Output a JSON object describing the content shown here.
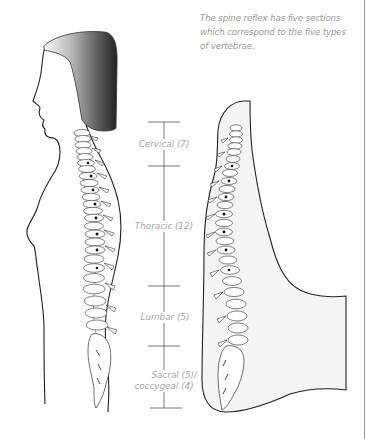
{
  "caption": {
    "line1": "The spine reflex has five sections",
    "line2": "which correspond to the five types",
    "line3": "of vertebrae."
  },
  "scale": {
    "segments": [
      {
        "label": "Cervical (7)",
        "top": 122,
        "bottom": 166
      },
      {
        "label": "Thoracic (12)",
        "top": 166,
        "bottom": 286
      },
      {
        "label": "Lumbar (5)",
        "top": 286,
        "bottom": 346
      },
      {
        "label": "Sacral (5)/",
        "label2": "coccygeal (4)",
        "top": 346,
        "bottom": 408
      }
    ]
  },
  "figures": {
    "left": "side-profile-woman-with-spine",
    "right": "foot-sole-with-spine-reflex-zone"
  },
  "colors": {
    "line": "#222222",
    "label": "#a5a5a5",
    "hair_light": "#f2f2f2",
    "hair_dark": "#2a2a2a",
    "foot_fill": "#f4f4f4"
  }
}
